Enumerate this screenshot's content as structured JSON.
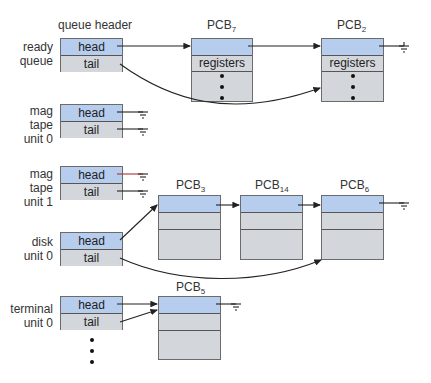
{
  "header_title": "queue header",
  "queues": [
    {
      "id": "ready",
      "label_lines": [
        "ready",
        "queue"
      ],
      "head": "head",
      "tail": "tail"
    },
    {
      "id": "mag0",
      "label_lines": [
        "mag",
        "tape",
        "unit 0"
      ],
      "head": "head",
      "tail": "tail"
    },
    {
      "id": "mag1",
      "label_lines": [
        "mag",
        "tape",
        "unit 1"
      ],
      "head": "head",
      "tail": "tail"
    },
    {
      "id": "disk0",
      "label_lines": [
        "disk",
        "unit 0"
      ],
      "head": "head",
      "tail": "tail"
    },
    {
      "id": "term0",
      "label_lines": [
        "terminal",
        "unit 0"
      ],
      "head": "head",
      "tail": "tail"
    }
  ],
  "pcbs": [
    {
      "name": "PCB",
      "sub": "7",
      "field": "registers"
    },
    {
      "name": "PCB",
      "sub": "2",
      "field": "registers"
    },
    {
      "name": "PCB",
      "sub": "3"
    },
    {
      "name": "PCB",
      "sub": "14"
    },
    {
      "name": "PCB",
      "sub": "6"
    },
    {
      "name": "PCB",
      "sub": "5"
    }
  ],
  "colors": {
    "head": "#b7cdee",
    "body": "#d3d6db",
    "border": "#6b6b6b"
  }
}
